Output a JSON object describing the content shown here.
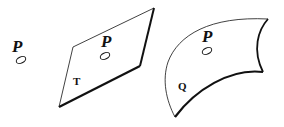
{
  "figure": {
    "point_label": "P",
    "panels": [
      {
        "id": "isolated-point",
        "point_label": "P"
      },
      {
        "id": "flat-plane",
        "point_label": "P",
        "surface_label": "T"
      },
      {
        "id": "curved-surface",
        "point_label": "P",
        "surface_label": "Q"
      }
    ]
  },
  "colors": {
    "stroke": "#111111",
    "background": "#ffffff"
  }
}
